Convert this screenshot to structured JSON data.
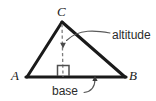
{
  "figure": {
    "type": "geometry-diagram",
    "width": 156,
    "height": 101,
    "background_color": "#ffffff",
    "stroke_color": "#1a1a1a",
    "leader_color": "#555555",
    "dashed_color": "#777777",
    "vertices": {
      "A": {
        "label": "A",
        "x": 27,
        "y": 77,
        "label_x": 11,
        "label_y": 80
      },
      "B": {
        "label": "B",
        "x": 125,
        "y": 77,
        "label_x": 129,
        "label_y": 80
      },
      "C": {
        "label": "C",
        "x": 62,
        "y": 22,
        "label_x": 57,
        "label_y": 16
      }
    },
    "altitude": {
      "label": "altitude",
      "label_x": 112,
      "label_y": 39,
      "from_x": 62,
      "from_y": 23,
      "to_x": 63,
      "to_y": 77,
      "arrow_tip_x": 63,
      "arrow_tip_y": 47
    },
    "base": {
      "label": "base",
      "label_x": 52,
      "label_y": 95,
      "from_x": 27,
      "from_y": 77,
      "to_x": 125,
      "to_y": 77,
      "arrow_tip_x": 95,
      "arrow_tip_y": 76
    },
    "right_angle": {
      "name": "right-angle-marker",
      "x": 57,
      "y": 65,
      "size": 11
    }
  }
}
